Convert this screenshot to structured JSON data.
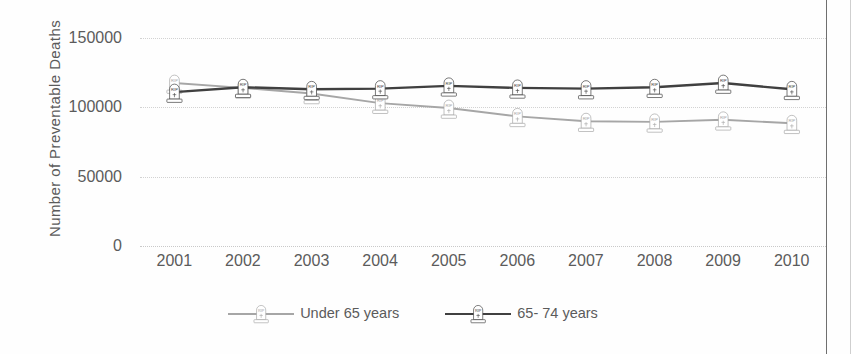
{
  "chart_data": {
    "type": "line",
    "title": "",
    "xlabel": "",
    "ylabel": "Number of Preventable Deaths",
    "categories": [
      "2001",
      "2002",
      "2003",
      "2004",
      "2005",
      "2006",
      "2007",
      "2008",
      "2009",
      "2010"
    ],
    "x": [
      2001,
      2002,
      2003,
      2004,
      2005,
      2006,
      2007,
      2008,
      2009,
      2010
    ],
    "ylim": [
      0,
      150000
    ],
    "yticks": [
      0,
      50000,
      100000,
      150000
    ],
    "ytick_labels": [
      "0",
      "50000",
      "100000",
      "150000"
    ],
    "grid": true,
    "legend_position": "bottom",
    "marker_style": "tombstone-rip",
    "series": [
      {
        "name": "Under 65 years",
        "color": "#a6a6a6",
        "values": [
          117500,
          114000,
          110000,
          103000,
          99500,
          93500,
          90000,
          89500,
          91000,
          88500
        ]
      },
      {
        "name": "65- 74 years",
        "color": "#404040",
        "values": [
          111000,
          114500,
          113000,
          113500,
          115500,
          114000,
          113500,
          114500,
          117500,
          113000
        ]
      }
    ]
  },
  "axis": {
    "y_title": "Number of Preventable Deaths",
    "y_tick_labels": [
      "150000",
      "100000",
      "50000",
      "0"
    ],
    "x_tick_labels": [
      "2001",
      "2002",
      "2003",
      "2004",
      "2005",
      "2006",
      "2007",
      "2008",
      "2009",
      "2010"
    ]
  },
  "legend": {
    "items": [
      {
        "label": "Under 65 years",
        "color": "#a6a6a6"
      },
      {
        "label": "65- 74 years",
        "color": "#404040"
      }
    ]
  },
  "colors": {
    "series_under65": "#a6a6a6",
    "series_65_74": "#404040",
    "gridline": "#d2d2d2",
    "text": "#5b5b5b",
    "frame": "#6f6f6f",
    "background": "#fefefe"
  }
}
